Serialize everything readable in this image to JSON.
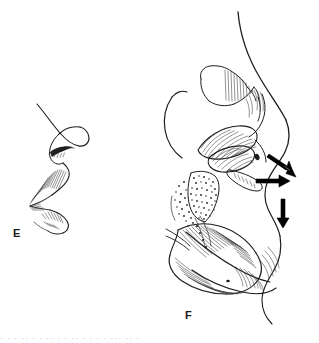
{
  "document": {
    "kind": "anatomical-line-illustration",
    "background_color": "#ffffff",
    "ink_color": "#1c1c1c",
    "width": 319,
    "height": 343
  },
  "panels": [
    {
      "id": "E",
      "label": "E",
      "label_x": 13,
      "label_y": 228,
      "description": "Sagittal profile line drawing of nose, nasal vestibule and upper lip with fine hatching"
    },
    {
      "id": "F",
      "label": "F",
      "label_x": 185,
      "label_y": 310,
      "description": "Sagittal section of nasal cavity, hard palate, soft palate, pharynx and tongue with hatching, stippling and airflow arrows"
    }
  ],
  "arrows": [
    {
      "name": "airflow-arrow-diagonal",
      "direction": "down-right",
      "x1": 268,
      "y1": 158,
      "x2": 294,
      "y2": 175
    },
    {
      "name": "airflow-arrow-horizontal",
      "direction": "right",
      "x1": 257,
      "y1": 181,
      "x2": 288,
      "y2": 181
    },
    {
      "name": "airflow-arrow-vertical",
      "direction": "down",
      "x1": 283,
      "y1": 200,
      "x2": 283,
      "y2": 226
    }
  ],
  "caption": {
    "cropped_text_fragment": "partial caption line cropped at lower edge"
  },
  "colors": {
    "ink": "#1c1c1c",
    "hatch": "#2a2a2a",
    "arrow": "#000000",
    "page": "#ffffff"
  }
}
